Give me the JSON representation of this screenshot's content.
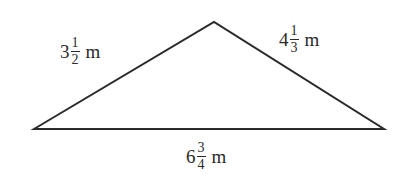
{
  "diagram": {
    "type": "triangle",
    "line_color": "#2a2a2a",
    "sides": {
      "left": {
        "whole": "3",
        "numerator": "1",
        "denominator": "2",
        "unit": "m"
      },
      "right": {
        "whole": "4",
        "numerator": "1",
        "denominator": "3",
        "unit": "m"
      },
      "base": {
        "whole": "6",
        "numerator": "3",
        "denominator": "4",
        "unit": "m"
      }
    }
  }
}
